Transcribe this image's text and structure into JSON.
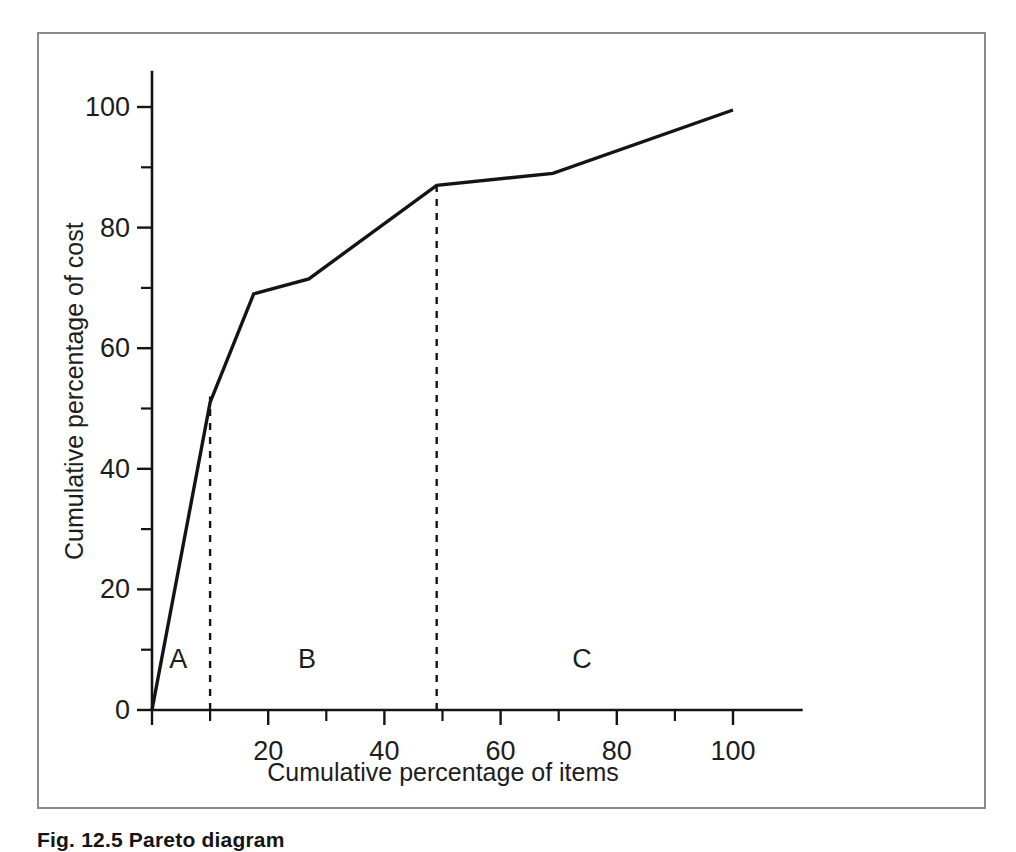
{
  "figure": {
    "caption": "Fig. 12.5 Pareto diagram"
  },
  "chart_data": {
    "type": "line",
    "title": "",
    "subtitle": "",
    "xlabel": "Cumulative percentage of items",
    "ylabel": "Cumulative percentage of cost",
    "xlim": [
      0,
      112
    ],
    "ylim": [
      0,
      106
    ],
    "grid": false,
    "legend_position": "none",
    "x_major_ticks": [
      20,
      40,
      60,
      80,
      100
    ],
    "x_major_tick_labels": [
      "20",
      "40",
      "60",
      "80",
      "100"
    ],
    "x_minor_ticks": [
      10,
      30,
      50,
      70,
      90
    ],
    "y_major_ticks": [
      0,
      20,
      40,
      60,
      80,
      100
    ],
    "y_major_tick_labels": [
      "0",
      "20",
      "40",
      "60",
      "80",
      "100"
    ],
    "y_minor_ticks": [
      10,
      30,
      50,
      70,
      90
    ],
    "series": [
      {
        "name": "Cumulative cost curve",
        "color": "#141414",
        "x": [
          0,
          10,
          17.5,
          27,
          49,
          69,
          100
        ],
        "y": [
          0,
          51,
          69,
          71.5,
          87,
          89,
          99.5
        ]
      }
    ],
    "annotations": [
      {
        "type": "vline",
        "name": "a-b-divider",
        "x": 10,
        "y_from": 0,
        "y_to": 52,
        "style": "dashed",
        "color": "#141414"
      },
      {
        "type": "vline",
        "name": "b-c-divider",
        "x": 49,
        "y_from": 0,
        "y_to": 87,
        "style": "dashed",
        "color": "#141414"
      },
      {
        "type": "text",
        "name": "region-a",
        "label": "A",
        "x": 4.5,
        "y": 8.5
      },
      {
        "type": "text",
        "name": "region-b",
        "label": "B",
        "x": 26.7,
        "y": 8.5
      },
      {
        "type": "text",
        "name": "region-c",
        "label": "C",
        "x": 74.0,
        "y": 8.5
      }
    ]
  },
  "colors": {
    "frame_border": "#8a8a8a",
    "axis": "#141414",
    "curve": "#141414",
    "text": "#1d1d1d",
    "background": "#ffffff"
  }
}
